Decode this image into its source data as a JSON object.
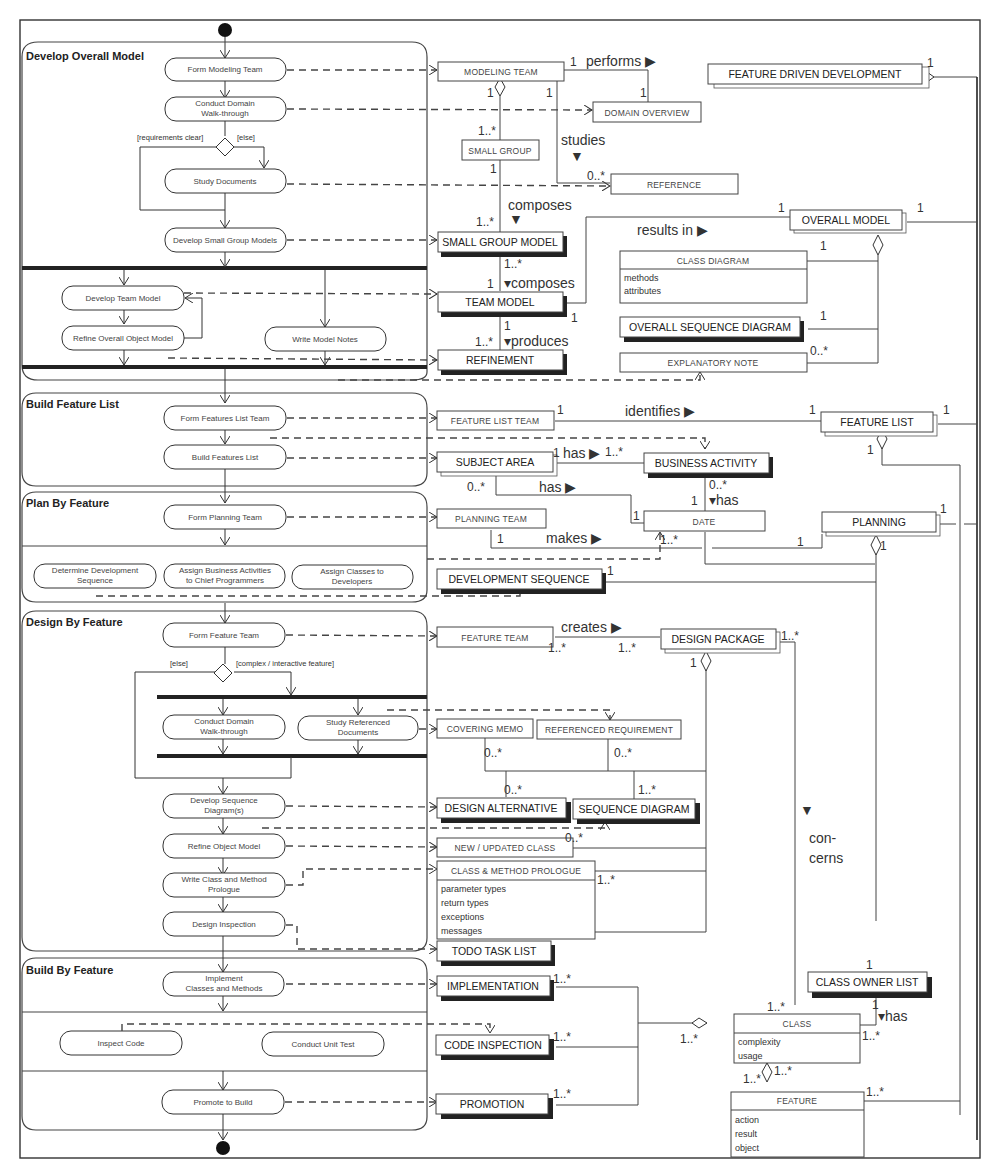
{
  "diagram": {
    "regions": [
      {
        "id": "develop-overall-model",
        "title": "Develop Overall Model"
      },
      {
        "id": "build-feature-list",
        "title": "Build Feature List"
      },
      {
        "id": "plan-by-feature",
        "title": "Plan By Feature"
      },
      {
        "id": "design-by-feature",
        "title": "Design By Feature"
      },
      {
        "id": "build-by-feature",
        "title": "Build By Feature"
      }
    ],
    "activities": {
      "form_modeling_team": [
        "Form Modeling Team"
      ],
      "conduct_domain_walkthrough_1": [
        "Conduct Domain",
        "Walk-through"
      ],
      "study_documents": [
        "Study Documents"
      ],
      "develop_small_group_models": [
        "Develop Small Group Models"
      ],
      "develop_team_model": [
        "Develop Team Model"
      ],
      "refine_overall_object_model": [
        "Refine Overall Object Model"
      ],
      "write_model_notes": [
        "Write Model Notes"
      ],
      "form_features_list_team": [
        "Form Features List Team"
      ],
      "build_features_list": [
        "Build Features List"
      ],
      "form_planning_team": [
        "Form Planning Team"
      ],
      "determine_development_sequence": [
        "Determine Development",
        "Sequence"
      ],
      "assign_business_activities": [
        "Assign Business Activities",
        "to Chief Programmers"
      ],
      "assign_classes": [
        "Assign Classes to",
        "Developers"
      ],
      "form_feature_team": [
        "Form Feature Team"
      ],
      "conduct_domain_walkthrough_2": [
        "Conduct Domain",
        "Walk-through"
      ],
      "study_referenced_documents": [
        "Study Referenced",
        "Documents"
      ],
      "develop_sequence_diagrams": [
        "Develop Sequence",
        "Diagram(s)"
      ],
      "refine_object_model": [
        "Refine Object Model"
      ],
      "write_class_method_prologue": [
        "Write Class and Method",
        "Prologue"
      ],
      "design_inspection": [
        "Design Inspection"
      ],
      "implement_classes": [
        "Implement",
        "Classes and Methods"
      ],
      "inspect_code": [
        "Inspect Code"
      ],
      "conduct_unit_test": [
        "Conduct Unit Test"
      ],
      "promote_to_build": [
        "Promote to Build"
      ]
    },
    "guards": {
      "requirements_clear": "[requirements clear]",
      "else_1": "[else]",
      "else_2": "[else]",
      "complex_feature": "[complex / interactive feature]"
    },
    "classes": {
      "modeling_team": {
        "name": "MODELING TEAM"
      },
      "feature_driven_development": {
        "name": "FEATURE DRIVEN DEVELOPMENT"
      },
      "domain_overview": {
        "name": "DOMAIN OVERVIEW"
      },
      "small_group": {
        "name": "SMALL GROUP"
      },
      "reference": {
        "name": "REFERENCE"
      },
      "small_group_model": {
        "name": "SMALL GROUP MODEL"
      },
      "overall_model": {
        "name": "OVERALL MODEL"
      },
      "team_model": {
        "name": "TEAM MODEL"
      },
      "class_diagram": {
        "name": "CLASS DIAGRAM",
        "attributes": [
          "methods",
          "attributes"
        ]
      },
      "overall_sequence_diagram": {
        "name": "OVERALL SEQUENCE DIAGRAM"
      },
      "refinement": {
        "name": "REFINEMENT"
      },
      "explanatory_note": {
        "name": "EXPLANATORY NOTE"
      },
      "feature_list_team": {
        "name": "FEATURE LIST TEAM"
      },
      "feature_list": {
        "name": "FEATURE LIST"
      },
      "subject_area": {
        "name": "SUBJECT AREA"
      },
      "business_activity": {
        "name": "BUSINESS ACTIVITY"
      },
      "planning_team": {
        "name": "PLANNING TEAM"
      },
      "date": {
        "name": "DATE"
      },
      "planning": {
        "name": "PLANNING"
      },
      "development_sequence": {
        "name": "DEVELOPMENT SEQUENCE"
      },
      "feature_team": {
        "name": "FEATURE TEAM"
      },
      "design_package": {
        "name": "DESIGN PACKAGE"
      },
      "covering_memo": {
        "name": "COVERING MEMO"
      },
      "referenced_requirement": {
        "name": "REFERENCED REQUIREMENT"
      },
      "design_alternative": {
        "name": "DESIGN ALTERNATIVE"
      },
      "sequence_diagram": {
        "name": "SEQUENCE DIAGRAM"
      },
      "new_updated_class": {
        "name": "NEW / UPDATED CLASS"
      },
      "class_method_prologue": {
        "name": "CLASS & METHOD PROLOGUE",
        "attributes": [
          "parameter types",
          "return types",
          "exceptions",
          "messages"
        ]
      },
      "todo_task_list": {
        "name": "TODO TASK LIST"
      },
      "implementation": {
        "name": "IMPLEMENTATION"
      },
      "code_inspection": {
        "name": "CODE INSPECTION"
      },
      "promotion": {
        "name": "PROMOTION"
      },
      "class_owner_list": {
        "name": "CLASS OWNER LIST"
      },
      "class": {
        "name": "CLASS",
        "attributes": [
          "complexity",
          "usage"
        ]
      },
      "feature": {
        "name": "FEATURE",
        "attributes": [
          "action",
          "result",
          "object"
        ]
      }
    },
    "roles": {
      "performs": "performs ▶",
      "studies": "studies",
      "studies_arrow": "▼",
      "composes_1": "composes",
      "composes_1_arrow": "▼",
      "composes_2": "▾composes",
      "produces": "▾produces",
      "results_in": "results in ▶",
      "identifies": "identifies ▶",
      "has_1": "has ▶",
      "has_2": "has ▶",
      "has_3": "▾has",
      "makes": "makes ▶",
      "creates": "creates ▶",
      "concerns_1": "con-",
      "concerns_2": "cerns",
      "concerns_arrow": "▼",
      "has_4": "▾has"
    },
    "multiplicities": {
      "one": "1",
      "one_many": "1..*",
      "zero_many": "0..*"
    }
  }
}
